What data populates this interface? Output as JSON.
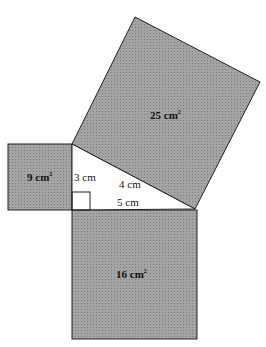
{
  "diagram": {
    "type": "pythagorean-squares",
    "fill_color": "#9a9a9a",
    "stroke_color": "#222222",
    "triangle": {
      "side_vertical": "3 cm",
      "side_horizontal": "4 cm",
      "hypotenuse_label_bottom": "5 cm"
    },
    "squares": {
      "left": {
        "area": "9 cm",
        "sup": "2"
      },
      "top": {
        "area": "25 cm",
        "sup": "2"
      },
      "bottom": {
        "area": "16 cm",
        "sup": "2"
      }
    }
  }
}
